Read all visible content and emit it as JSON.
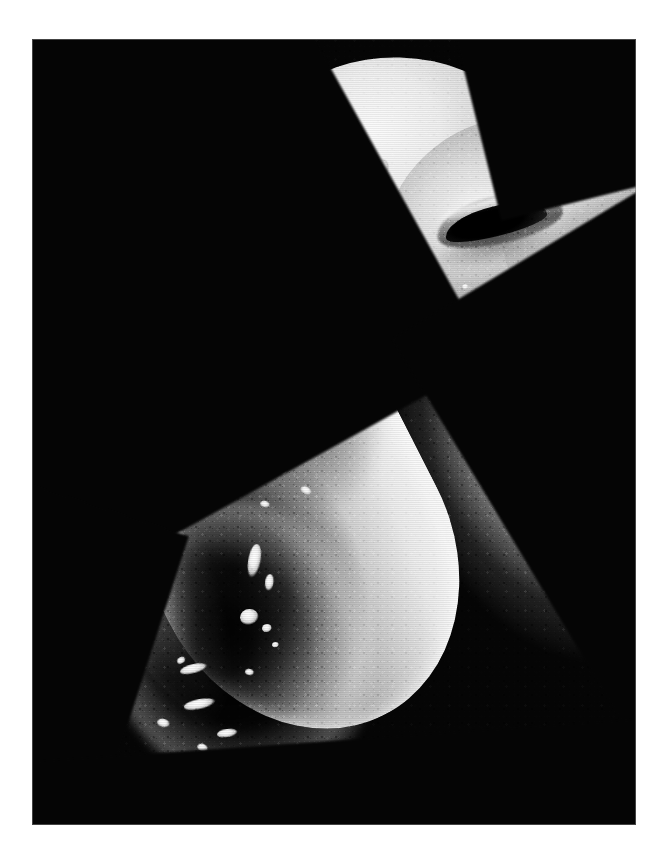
{
  "document": {
    "kind": "scanning-electron-micrograph",
    "orientation": "portrait",
    "canvas": {
      "width": 666,
      "height": 846
    },
    "page_background_color": "#ffffff"
  },
  "plate": {
    "name": "micrograph-plate",
    "background_color": "#050505",
    "left": 32,
    "top": 39,
    "width": 604,
    "height": 786,
    "border_color": "#787878"
  },
  "specimen": {
    "description": "Elongated club-shaped organism viewed at high magnification, oriented diagonally from lower-left to upper-right.",
    "palette": {
      "highlight": "#fbfbfb",
      "midtone": "#b4b4b4",
      "shadow": "#555555",
      "deep_shadow": "#0a0a0a",
      "background": "#050505"
    },
    "features": [
      {
        "id": "body",
        "label": "main-body",
        "note": "granular cuticle surface"
      },
      {
        "id": "dome",
        "label": "anterior-dome",
        "note": "bright rounded shoulder"
      },
      {
        "id": "head_lobe",
        "label": "head-lobe",
        "note": "lobe surrounding the aperture"
      },
      {
        "id": "neck",
        "label": "neck",
        "note": "narrowing extension reaching the right frame edge"
      },
      {
        "id": "aperture",
        "label": "slit-aperture",
        "note": "dark elongated opening, pore or mouth"
      },
      {
        "id": "depression",
        "label": "terminal-depression",
        "note": "dark concavity in the posterior end with bright debris"
      }
    ]
  },
  "specks": [
    {
      "left": 345,
      "top": 120,
      "w": 13,
      "h": 16,
      "rot": -28
    },
    {
      "left": 355,
      "top": 222,
      "w": 9,
      "h": 10,
      "rot": 0
    },
    {
      "left": 379,
      "top": 218,
      "w": 17,
      "h": 14,
      "rot": 14
    },
    {
      "left": 545,
      "top": 207,
      "w": 16,
      "h": 15,
      "rot": 0
    },
    {
      "left": 200,
      "top": 335,
      "w": 19,
      "h": 17,
      "rot": -10
    },
    {
      "left": 300,
      "top": 310,
      "w": 11,
      "h": 9,
      "rot": 20
    },
    {
      "left": 330,
      "top": 378,
      "w": 10,
      "h": 7,
      "rot": 35
    },
    {
      "left": 287,
      "top": 393,
      "w": 15,
      "h": 11,
      "rot": 28
    },
    {
      "left": 355,
      "top": 340,
      "w": 8,
      "h": 6,
      "rot": 40
    },
    {
      "left": 398,
      "top": 300,
      "w": 9,
      "h": 6,
      "rot": -20
    },
    {
      "left": 425,
      "top": 352,
      "w": 8,
      "h": 6,
      "rot": 25
    },
    {
      "left": 268,
      "top": 448,
      "w": 12,
      "h": 8,
      "rot": 32
    },
    {
      "left": 228,
      "top": 462,
      "w": 10,
      "h": 7,
      "rot": 18
    },
    {
      "left": 112,
      "top": 487,
      "w": 42,
      "h": 30,
      "rot": -18
    },
    {
      "left": 216,
      "top": 505,
      "w": 13,
      "h": 36,
      "rot": 8
    },
    {
      "left": 233,
      "top": 535,
      "w": 9,
      "h": 18,
      "rot": 4
    },
    {
      "left": 208,
      "top": 570,
      "w": 19,
      "h": 17,
      "rot": 0
    },
    {
      "left": 230,
      "top": 585,
      "w": 10,
      "h": 9,
      "rot": 0
    },
    {
      "left": 240,
      "top": 603,
      "w": 7,
      "h": 6,
      "rot": 0
    },
    {
      "left": 213,
      "top": 630,
      "w": 9,
      "h": 7,
      "rot": 15
    },
    {
      "left": 145,
      "top": 618,
      "w": 9,
      "h": 7,
      "rot": -25
    },
    {
      "left": 148,
      "top": 625,
      "w": 28,
      "h": 10,
      "rot": -12
    },
    {
      "left": 152,
      "top": 660,
      "w": 32,
      "h": 11,
      "rot": -10
    },
    {
      "left": 185,
      "top": 690,
      "w": 21,
      "h": 9,
      "rot": -6
    },
    {
      "left": 125,
      "top": 680,
      "w": 13,
      "h": 9,
      "rot": 18
    },
    {
      "left": 165,
      "top": 705,
      "w": 11,
      "h": 8,
      "rot": 22
    },
    {
      "left": 118,
      "top": 560,
      "w": 10,
      "h": 8,
      "rot": 0
    },
    {
      "left": 104,
      "top": 600,
      "w": 8,
      "h": 7,
      "rot": 0
    },
    {
      "left": 247,
      "top": 430,
      "w": 8,
      "h": 6,
      "rot": 0
    },
    {
      "left": 430,
      "top": 245,
      "w": 7,
      "h": 6,
      "rot": 0
    },
    {
      "left": 470,
      "top": 262,
      "w": 8,
      "h": 6,
      "rot": 0
    },
    {
      "left": 258,
      "top": 150,
      "w": 10,
      "h": 12,
      "rot": -30
    }
  ]
}
